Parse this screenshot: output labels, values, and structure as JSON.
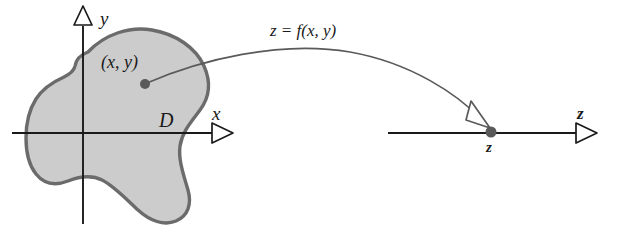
{
  "figure": {
    "colors": {
      "region_fill": "#cccccc",
      "region_outline": "#6b6b6b",
      "axis": "#1a1a1a",
      "curve": "#5a5a5a",
      "point": "#5a5a5a",
      "text": "#1a1a1a"
    }
  },
  "domain_plane": {
    "y_axis_label": "y",
    "x_axis_label": "x",
    "region_label": "D",
    "point_label": "(x, y)",
    "y_axis_arrow_icon": "triangle-up-outline-icon",
    "x_axis_arrow_icon": "triangle-right-outline-icon",
    "point_icon": "filled-dot-icon"
  },
  "mapping": {
    "function_label": "z = f(x, y)",
    "arrow_icon": "curved-arrow-icon",
    "arrowhead_icon": "triangle-outline-arrowhead-icon"
  },
  "z_line": {
    "axis_label": "z",
    "point_label": "z",
    "axis_arrow_icon": "triangle-right-outline-icon",
    "point_icon": "filled-dot-icon"
  }
}
